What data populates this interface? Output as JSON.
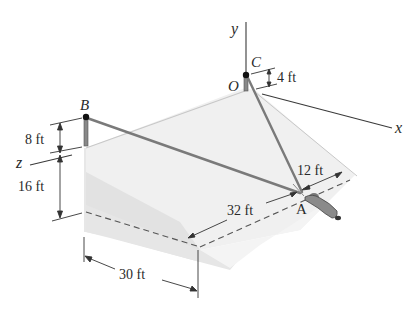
{
  "figure": {
    "points": {
      "B": "B",
      "C": "C",
      "O": "O",
      "A": "A"
    },
    "axes": {
      "x": "x",
      "y": "y",
      "z": "z"
    },
    "dimensions": {
      "b_post_height": "8 ft",
      "wall_height": "16 ft",
      "c_post_height": "4 ft",
      "a_offset_top": "12 ft",
      "a_offset_front": "32 ft",
      "width": "30 ft"
    },
    "colors": {
      "slope_face": "#ececec",
      "side_face": "#dcdcdc",
      "cable": "#7a7a7a",
      "line": "#3a3a3a",
      "ink": "#111111"
    }
  }
}
